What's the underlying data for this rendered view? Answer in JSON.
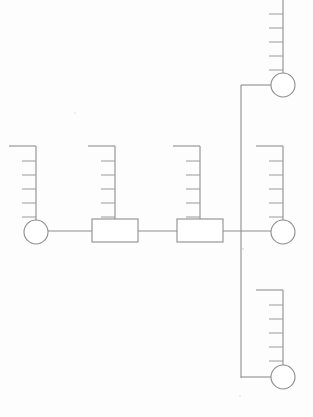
{
  "document": {
    "title": "Schematic Line Diagram",
    "background_color": "#fdfdfd",
    "line_color": "#8e8e8e",
    "width": 313,
    "height": 417
  },
  "legend": {
    "circle_label": "node-terminal",
    "rect_label": "inline-component",
    "comb_label": "comb-connector",
    "bus_label": "vertical-bus"
  },
  "diagram": {
    "type": "line-schematic",
    "main_bus_y": 231,
    "vertical_bus_x": 241,
    "vertical_bus_top": 85,
    "vertical_bus_bottom": 378,
    "comb": {
      "tick_count": 5,
      "tick_length": 14,
      "top_bar_length": 30,
      "spine_height": 86
    },
    "circles": [
      {
        "name": "node-left",
        "cx": 36,
        "cy": 232,
        "r": 12
      },
      {
        "name": "node-right-top",
        "cx": 283,
        "cy": 85,
        "r": 12
      },
      {
        "name": "node-right-middle",
        "cx": 283,
        "cy": 232,
        "r": 12
      },
      {
        "name": "node-right-bottom",
        "cx": 283,
        "cy": 377,
        "r": 12
      }
    ],
    "rectangles": [
      {
        "name": "component-one",
        "x": 92,
        "y": 219,
        "width": 46,
        "height": 23
      },
      {
        "name": "component-two",
        "x": 177,
        "y": 219,
        "width": 46,
        "height": 23
      }
    ],
    "combs": [
      {
        "name": "comb-left",
        "spine_x": 36,
        "top_y": 146,
        "bottom_y": 220,
        "bar_to_x": 9
      },
      {
        "name": "comb-mid-one",
        "spine_x": 115,
        "top_y": 146,
        "bottom_y": 219,
        "bar_to_x": 88
      },
      {
        "name": "comb-mid-two",
        "spine_x": 200,
        "top_y": 146,
        "bottom_y": 219,
        "bar_to_x": 173
      },
      {
        "name": "comb-right-middle",
        "spine_x": 283,
        "top_y": 146,
        "bottom_y": 220,
        "bar_to_x": 256
      },
      {
        "name": "comb-right-top",
        "spine_x": 283,
        "top_y": 0,
        "bottom_y": 73,
        "bar_to_x": 283
      },
      {
        "name": "comb-right-bottom",
        "spine_x": 283,
        "top_y": 290,
        "bottom_y": 365,
        "bar_to_x": 256
      }
    ],
    "connectors": [
      {
        "name": "connector-left-to-comp-one",
        "x1": 48,
        "y1": 231,
        "x2": 92,
        "y2": 231
      },
      {
        "name": "connector-comp-one-to-comp-two",
        "x1": 138,
        "y1": 231,
        "x2": 177,
        "y2": 231
      },
      {
        "name": "connector-comp-two-to-node-right",
        "x1": 223,
        "y1": 231,
        "x2": 271,
        "y2": 231
      },
      {
        "name": "branch-top-stub",
        "x1": 241,
        "y1": 85,
        "x2": 271,
        "y2": 85
      },
      {
        "name": "branch-bottom-stub",
        "x1": 241,
        "y1": 377,
        "x2": 271,
        "y2": 377
      }
    ]
  }
}
